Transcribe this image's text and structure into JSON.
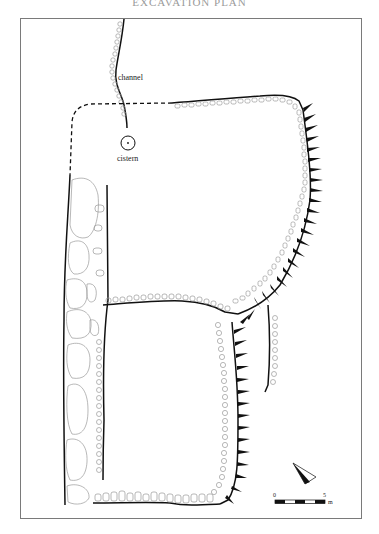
{
  "header": {
    "text": "EXCAVATION PLAN"
  },
  "labels": {
    "channel": "channel",
    "cistern": "cistern"
  },
  "scale_bar": {
    "start_label": "0",
    "end_label": "5",
    "unit": "m",
    "segments": 5
  },
  "north_arrow": {
    "icon": "north-arrow-icon"
  },
  "colors": {
    "wall_line": "#111111",
    "stone_outline": "#9a9a9a",
    "frame": "#7a7a7a",
    "background": "#ffffff"
  },
  "features": [
    "channel",
    "cistern",
    "west wall (large stones)",
    "north room",
    "south room",
    "rock-cut scarp (hachures)",
    "dashed reconstructed wall line"
  ]
}
